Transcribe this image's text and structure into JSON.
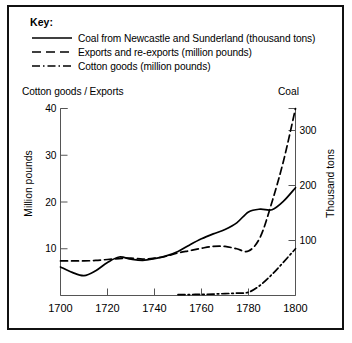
{
  "key": {
    "title": "Key:",
    "entries": [
      {
        "style": "solid",
        "label": "Coal from Newcastle and Sunderland (thousand tons)",
        "name": "legend-coal"
      },
      {
        "style": "dashed",
        "label": "Exports and re-exports (million pounds)",
        "name": "legend-exports"
      },
      {
        "style": "dashdot",
        "label": "Cotton goods (million pounds)",
        "name": "legend-cotton"
      }
    ]
  },
  "axes": {
    "left_header": "Cotton goods / Exports",
    "right_header": "Coal",
    "left_title": "Million pounds",
    "right_title": "Thousand tons",
    "left_ticks": [
      "40",
      "30",
      "20",
      "10"
    ],
    "right_ticks": [
      "300",
      "200",
      "100"
    ],
    "x_ticks": [
      "1700",
      "1720",
      "1740",
      "1760",
      "1780",
      "1800"
    ]
  },
  "chart_data": {
    "type": "line",
    "title": "",
    "xlabel": "",
    "ylabel": "Million pounds",
    "y2label": "Thousand tons",
    "xlim": [
      1700,
      1800
    ],
    "ylim": [
      0,
      40
    ],
    "y2lim": [
      0,
      340
    ],
    "grid": false,
    "legend_position": "top",
    "x_ticks": [
      1700,
      1720,
      1740,
      1760,
      1780,
      1800
    ],
    "y_ticks": [
      10,
      20,
      30,
      40
    ],
    "y2_ticks": [
      100,
      200,
      300
    ],
    "series": [
      {
        "name": "Coal from Newcastle and Sunderland (thousand tons)",
        "axis": "right",
        "linestyle": "solid",
        "color": "#000000",
        "x": [
          1700,
          1705,
          1710,
          1715,
          1720,
          1725,
          1730,
          1735,
          1740,
          1745,
          1750,
          1755,
          1760,
          1765,
          1770,
          1775,
          1780,
          1785,
          1790,
          1795,
          1800
        ],
        "values": [
          52,
          42,
          36,
          45,
          60,
          70,
          66,
          64,
          67,
          72,
          80,
          92,
          103,
          112,
          120,
          132,
          152,
          157,
          156,
          172,
          196
        ]
      },
      {
        "name": "Exports and re-exports (million pounds)",
        "axis": "left",
        "linestyle": "dashed",
        "color": "#000000",
        "x": [
          1700,
          1705,
          1710,
          1715,
          1720,
          1725,
          1730,
          1735,
          1740,
          1745,
          1750,
          1755,
          1760,
          1765,
          1770,
          1775,
          1780,
          1785,
          1790,
          1795,
          1800
        ],
        "values": [
          7.4,
          7.4,
          7.4,
          7.5,
          7.7,
          7.9,
          8.0,
          7.8,
          8.0,
          8.4,
          9.1,
          9.6,
          10.1,
          10.5,
          10.5,
          10.0,
          9.5,
          12.5,
          20.0,
          29.0,
          40.0
        ]
      },
      {
        "name": "Cotton goods (million pounds)",
        "axis": "left",
        "linestyle": "dashdot",
        "color": "#000000",
        "x": [
          1750,
          1755,
          1760,
          1765,
          1770,
          1775,
          1780,
          1785,
          1790,
          1795,
          1800
        ],
        "values": [
          0.2,
          0.2,
          0.25,
          0.3,
          0.4,
          0.5,
          0.7,
          2.2,
          4.5,
          7.2,
          10.0
        ]
      }
    ]
  }
}
